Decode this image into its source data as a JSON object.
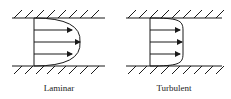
{
  "diagram": {
    "colors": {
      "line": "#1a1a1a",
      "background": "#ffffff"
    },
    "panels": [
      {
        "id": "laminar",
        "label": "Laminar",
        "profile_shape": "parabolic",
        "wall_top_y": 18,
        "wall_bottom_y": 66,
        "wall_x_start": 12,
        "wall_x_end": 105,
        "origin_x": 34,
        "arrows": [
          {
            "y": 30,
            "end_x": 72
          },
          {
            "y": 42,
            "end_x": 80
          },
          {
            "y": 54,
            "end_x": 72
          }
        ],
        "label_x": 59,
        "label_y": 91
      },
      {
        "id": "turbulent",
        "label": "Turbulent",
        "profile_shape": "flat / blunt",
        "wall_top_y": 18,
        "wall_bottom_y": 66,
        "wall_x_start": 126,
        "wall_x_end": 222,
        "origin_x": 150,
        "arrows": [
          {
            "y": 30,
            "end_x": 180
          },
          {
            "y": 42,
            "end_x": 182
          },
          {
            "y": 54,
            "end_x": 180
          }
        ],
        "label_x": 174,
        "label_y": 91
      }
    ]
  }
}
